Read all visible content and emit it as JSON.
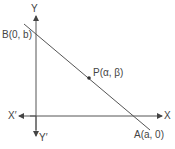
{
  "diagram": {
    "type": "coordinate-geometry",
    "colors": {
      "stroke": "#555555",
      "text": "#444444",
      "background": "#ffffff"
    },
    "axes": {
      "x_positive_label": "X",
      "x_negative_label": "X′",
      "y_positive_label": "Y",
      "y_negative_label": "Y′"
    },
    "points": {
      "B": {
        "name": "B",
        "coords": "(0, b)",
        "label": "B(0, b)"
      },
      "A": {
        "name": "A",
        "coords": "(a, 0)",
        "label": "A(a, 0)"
      },
      "P": {
        "name": "P",
        "coords": "(α, β)",
        "label": "P(α, β)"
      }
    }
  }
}
